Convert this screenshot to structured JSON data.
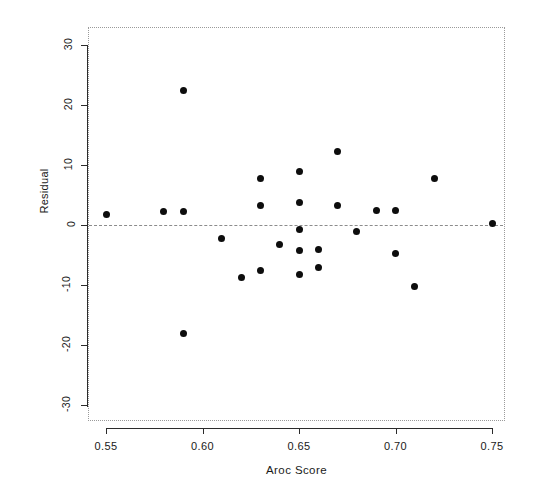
{
  "chart_data": {
    "type": "scatter",
    "title": "",
    "xlabel": "Aroc Score",
    "ylabel": "Residual",
    "xlim": [
      0.5405,
      0.7605
    ],
    "ylim": [
      -33.2,
      33.2
    ],
    "grid": false,
    "legend": "none",
    "xticks": [
      "0.55",
      "0.60",
      "0.65",
      "0.70",
      "0.75"
    ],
    "xtick_values": [
      0.55,
      0.6,
      0.65,
      0.7,
      0.75
    ],
    "yticks": [
      "30",
      "20",
      "10",
      "0",
      "-10",
      "-20",
      "-30"
    ],
    "ytick_values": [
      30,
      20,
      10,
      0,
      -10,
      -20,
      -30
    ],
    "reference_line": {
      "y": 0,
      "style": "dotted",
      "color": "#8c8c8c"
    },
    "marker": {
      "shape": "circle",
      "color": "#0d0d0d",
      "size": 7
    },
    "points": [
      {
        "x": 0.55,
        "y": 1.8
      },
      {
        "x": 0.58,
        "y": 2.2
      },
      {
        "x": 0.59,
        "y": 22.5
      },
      {
        "x": 0.59,
        "y": 2.2
      },
      {
        "x": 0.59,
        "y": -18.0
      },
      {
        "x": 0.61,
        "y": -2.2
      },
      {
        "x": 0.62,
        "y": -8.8
      },
      {
        "x": 0.63,
        "y": 7.8
      },
      {
        "x": 0.63,
        "y": 3.3
      },
      {
        "x": 0.63,
        "y": -7.5
      },
      {
        "x": 0.64,
        "y": -3.3
      },
      {
        "x": 0.65,
        "y": 9.0
      },
      {
        "x": 0.65,
        "y": 3.8
      },
      {
        "x": 0.65,
        "y": -0.8
      },
      {
        "x": 0.65,
        "y": -4.2
      },
      {
        "x": 0.65,
        "y": -8.2
      },
      {
        "x": 0.66,
        "y": -4.0
      },
      {
        "x": 0.66,
        "y": -7.0
      },
      {
        "x": 0.67,
        "y": 12.2
      },
      {
        "x": 0.67,
        "y": 3.2
      },
      {
        "x": 0.68,
        "y": -1.0
      },
      {
        "x": 0.69,
        "y": 2.4
      },
      {
        "x": 0.7,
        "y": 2.5
      },
      {
        "x": 0.7,
        "y": -4.8
      },
      {
        "x": 0.71,
        "y": -10.2
      },
      {
        "x": 0.72,
        "y": 7.8
      },
      {
        "x": 0.75,
        "y": 0.3
      }
    ]
  }
}
